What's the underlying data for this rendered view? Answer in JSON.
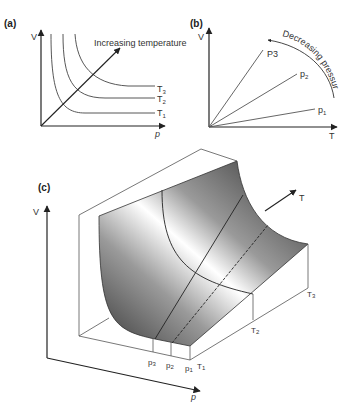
{
  "panels": {
    "a": {
      "label": "(a)",
      "y_axis": "V",
      "x_axis": "p",
      "arrow_label": "Increasing temperature",
      "curves": [
        "T3",
        "T2",
        "T1"
      ],
      "curve_labels": {
        "t3": "T",
        "t3_sub": "3",
        "t2": "T",
        "t2_sub": "2",
        "t1": "T",
        "t1_sub": "1"
      }
    },
    "b": {
      "label": "(b)",
      "y_axis": "V",
      "x_axis": "T",
      "arrow_label": "Decreasing pressure",
      "line_labels": {
        "p3": "P3",
        "p2": "p",
        "p2_sub": "2",
        "p1": "p",
        "p1_sub": "1"
      }
    },
    "c": {
      "label": "(c)",
      "y_axis": "V",
      "x_axis": "p",
      "t_axis": "T",
      "p_ticks": [
        {
          "t": "p",
          "s": "3"
        },
        {
          "t": "p",
          "s": "2"
        },
        {
          "t": "p",
          "s": "1"
        }
      ],
      "t_ticks": [
        {
          "t": "T",
          "s": "1"
        },
        {
          "t": "T",
          "s": "2"
        },
        {
          "t": "T",
          "s": "3"
        }
      ]
    }
  }
}
